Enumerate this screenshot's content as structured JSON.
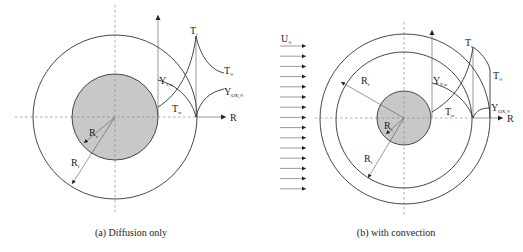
{
  "figure": {
    "panels": [
      {
        "id": "a",
        "caption": "(a) Diffusion only",
        "labels": {
          "flame_temperature": "T",
          "flame_temperature_sub": "f",
          "ambient_temperature": "T",
          "ambient_temperature_sub": "∞",
          "fuel_mass_fraction": "Y",
          "fuel_mass_fraction_sub": "F,w",
          "oxidizer_mass_fraction": "Y",
          "oxidizer_mass_fraction_sub": "OX,∞",
          "wall_temperature": "T",
          "wall_temperature_sub": "w",
          "radial_axis": "R",
          "droplet_radius": "R",
          "droplet_radius_sub": "s",
          "flame_radius": "R",
          "flame_radius_sub": "f"
        }
      },
      {
        "id": "b",
        "caption": "(b) with convection",
        "labels": {
          "freestream_velocity": "U",
          "freestream_velocity_sub": "∞",
          "flame_temperature": "T",
          "flame_temperature_sub": "f",
          "ambient_temperature": "T",
          "ambient_temperature_sub": "∞",
          "fuel_mass_fraction": "Y",
          "fuel_mass_fraction_sub": "F,w",
          "oxidizer_mass_fraction": "Y",
          "oxidizer_mass_fraction_sub": "OX,∞",
          "wall_temperature": "T",
          "wall_temperature_sub": "w",
          "radial_axis": "R",
          "flame_radius_upstream": "R",
          "flame_radius_upstream_sub": "f",
          "droplet_radius": "R",
          "droplet_radius_sub": "s",
          "flame_radius": "R",
          "flame_radius_sub": "f"
        },
        "flow_arrow_count": 15
      }
    ],
    "colors": {
      "droplet_fill": "#c8c8c8",
      "line": "#333333",
      "dashed_axis": "#888888"
    }
  }
}
